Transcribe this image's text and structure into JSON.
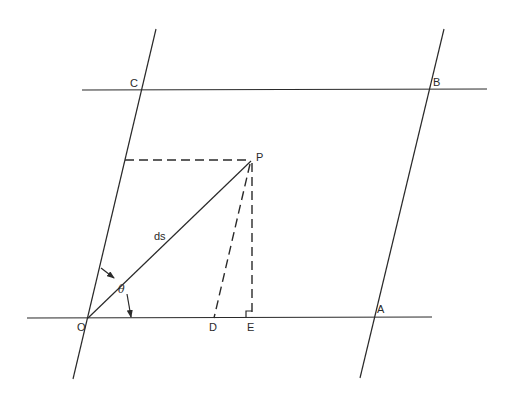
{
  "figure": {
    "labels": {
      "O": "O",
      "A": "A",
      "B": "B",
      "C": "C",
      "D": "D",
      "E": "E",
      "P": "P",
      "ds": "ds",
      "theta": "θ"
    },
    "colors": {
      "line": "#2a2a2a",
      "background": "#ffffff"
    }
  }
}
